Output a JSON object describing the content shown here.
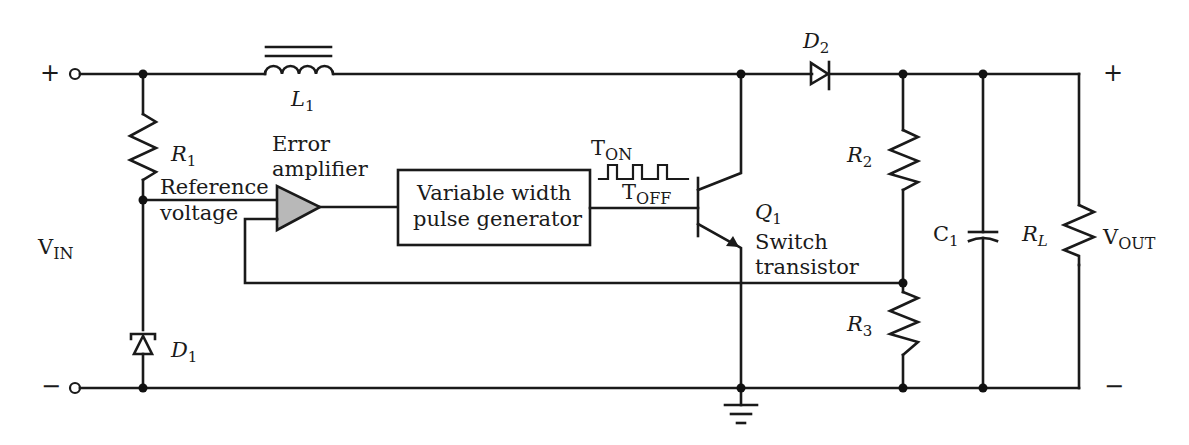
{
  "colors": {
    "wire": "#1a1a1a",
    "amplifier_fill": "#b8b8b8",
    "background": "#ffffff"
  },
  "input": {
    "plus": "+",
    "minus": "−",
    "label_main": "V",
    "label_sub": "IN"
  },
  "output": {
    "plus": "+",
    "minus": "−",
    "label_main": "V",
    "label_sub": "OUT"
  },
  "components": {
    "L1": {
      "main": "L",
      "sub": "1"
    },
    "R1": {
      "main": "R",
      "sub": "1"
    },
    "D1": {
      "main": "D",
      "sub": "1"
    },
    "D2": {
      "main": "D",
      "sub": "2"
    },
    "R2": {
      "main": "R",
      "sub": "2"
    },
    "R3": {
      "main": "R",
      "sub": "3"
    },
    "C1": {
      "main": "C",
      "sub": "1"
    },
    "RL": {
      "main": "R",
      "sub": "L"
    },
    "Q1": {
      "main": "Q",
      "sub": "1",
      "desc_line1": "Switch",
      "desc_line2": "transistor"
    }
  },
  "labels": {
    "error_amp_line1": "Error",
    "error_amp_line2": "amplifier",
    "reference_line1": "Reference",
    "reference_line2": "voltage",
    "pulse_gen_line1": "Variable width",
    "pulse_gen_line2": "pulse generator",
    "ton_main": "T",
    "ton_sub": "ON",
    "toff_main": "T",
    "toff_sub": "OFF"
  }
}
